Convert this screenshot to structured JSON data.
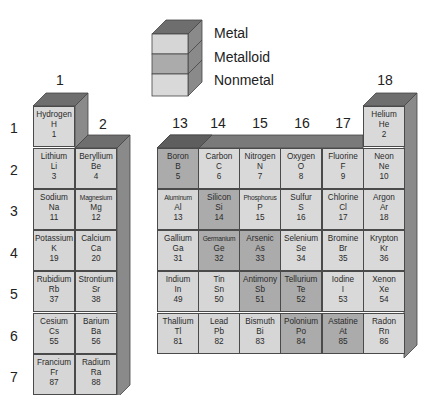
{
  "legend": {
    "items": [
      {
        "label": "Metal",
        "color": "#d6d6d6"
      },
      {
        "label": "Metalloid",
        "color": "#ababab"
      },
      {
        "label": "Nonmetal",
        "color": "#d9d9d9"
      }
    ]
  },
  "group_labels": {
    "g1": "1",
    "g2": "2",
    "g13": "13",
    "g14": "14",
    "g15": "15",
    "g16": "16",
    "g17": "17",
    "g18": "18"
  },
  "period_labels": [
    "1",
    "2",
    "3",
    "4",
    "5",
    "6",
    "7"
  ],
  "colors": {
    "metal": "#d6d6d6",
    "metalloid": "#ababab",
    "nonmetal": "#d9d9d9",
    "top_face": "#6e6e6e",
    "side_face": "#8a8a8a"
  },
  "elements": {
    "H": {
      "name": "Hydrogen",
      "symbol": "H",
      "number": "1"
    },
    "Li": {
      "name": "Lithium",
      "symbol": "Li",
      "number": "3"
    },
    "Be": {
      "name": "Beryllium",
      "symbol": "Be",
      "number": "4"
    },
    "Na": {
      "name": "Sodium",
      "symbol": "Na",
      "number": "11"
    },
    "Mg": {
      "name": "Magnesium",
      "symbol": "Mg",
      "number": "12"
    },
    "K": {
      "name": "Potassium",
      "symbol": "K",
      "number": "19"
    },
    "Ca": {
      "name": "Calcium",
      "symbol": "Ca",
      "number": "20"
    },
    "Rb": {
      "name": "Rubidium",
      "symbol": "Rb",
      "number": "37"
    },
    "Sr": {
      "name": "Strontium",
      "symbol": "Sr",
      "number": "38"
    },
    "Cs": {
      "name": "Cesium",
      "symbol": "Cs",
      "number": "55"
    },
    "Ba": {
      "name": "Barium",
      "symbol": "Ba",
      "number": "56"
    },
    "Fr": {
      "name": "Francium",
      "symbol": "Fr",
      "number": "87"
    },
    "Ra": {
      "name": "Radium",
      "symbol": "Ra",
      "number": "88"
    },
    "He": {
      "name": "Helium",
      "symbol": "He",
      "number": "2"
    },
    "B": {
      "name": "Boron",
      "symbol": "B",
      "number": "5"
    },
    "C": {
      "name": "Carbon",
      "symbol": "C",
      "number": "6"
    },
    "N": {
      "name": "Nitrogen",
      "symbol": "N",
      "number": "7"
    },
    "O": {
      "name": "Oxygen",
      "symbol": "O",
      "number": "8"
    },
    "F": {
      "name": "Fluorine",
      "symbol": "F",
      "number": "9"
    },
    "Ne": {
      "name": "Neon",
      "symbol": "Ne",
      "number": "10"
    },
    "Al": {
      "name": "Aluminum",
      "symbol": "Al",
      "number": "13"
    },
    "Si": {
      "name": "Silicon",
      "symbol": "Si",
      "number": "14"
    },
    "P": {
      "name": "Phosphorus",
      "symbol": "P",
      "number": "15"
    },
    "S": {
      "name": "Sulfur",
      "symbol": "S",
      "number": "16"
    },
    "Cl": {
      "name": "Chlorine",
      "symbol": "Cl",
      "number": "17"
    },
    "Ar": {
      "name": "Argon",
      "symbol": "Ar",
      "number": "18"
    },
    "Ga": {
      "name": "Gallium",
      "symbol": "Ga",
      "number": "31"
    },
    "Ge": {
      "name": "Germanium",
      "symbol": "Ge",
      "number": "32"
    },
    "As": {
      "name": "Arsenic",
      "symbol": "As",
      "number": "33"
    },
    "Se": {
      "name": "Selenium",
      "symbol": "Se",
      "number": "34"
    },
    "Br": {
      "name": "Bromine",
      "symbol": "Br",
      "number": "35"
    },
    "Kr": {
      "name": "Krypton",
      "symbol": "Kr",
      "number": "36"
    },
    "In": {
      "name": "Indium",
      "symbol": "In",
      "number": "49"
    },
    "Sn": {
      "name": "Tin",
      "symbol": "Sn",
      "number": "50"
    },
    "Sb": {
      "name": "Antimony",
      "symbol": "Sb",
      "number": "51"
    },
    "Te": {
      "name": "Tellurium",
      "symbol": "Te",
      "number": "52"
    },
    "I": {
      "name": "Iodine",
      "symbol": "I",
      "number": "53"
    },
    "Xe": {
      "name": "Xenon",
      "symbol": "Xe",
      "number": "54"
    },
    "Tl": {
      "name": "Thallium",
      "symbol": "Tl",
      "number": "81"
    },
    "Pb": {
      "name": "Lead",
      "symbol": "Pb",
      "number": "82"
    },
    "Bi": {
      "name": "Bismuth",
      "symbol": "Bi",
      "number": "83"
    },
    "Po": {
      "name": "Polonium",
      "symbol": "Po",
      "number": "84"
    },
    "At": {
      "name": "Astatine",
      "symbol": "At",
      "number": "85"
    },
    "Rn": {
      "name": "Radon",
      "symbol": "Rn",
      "number": "86"
    }
  }
}
